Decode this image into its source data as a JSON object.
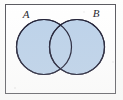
{
  "figure": {
    "type": "venn-diagram",
    "caption": "",
    "frame": {
      "x": 5,
      "y": 4,
      "width": 111,
      "height": 90,
      "stroke_color": "#5a5a60",
      "stroke_width": 1,
      "fill_color": "#ffffff"
    },
    "background_color": "#fdfdfc",
    "sets": [
      {
        "label": "A",
        "shape": "circle",
        "cx": 44,
        "cy": 47,
        "r": 27.5,
        "fill_color": "#bcd2ea",
        "stroke_color": "#1d1d33",
        "stroke_width": 1.2,
        "label_x": 26,
        "label_y": 18
      },
      {
        "label": "B",
        "shape": "circle",
        "cx": 77,
        "cy": 47,
        "r": 27.5,
        "fill_color": "#bcd2ea",
        "stroke_color": "#1d1d33",
        "stroke_width": 1.2,
        "label_x": 96,
        "label_y": 17
      }
    ],
    "intersection": {
      "shaded": true,
      "fill_color": "#bcd2ea",
      "description": "lens-shaped overlap region between circle A and circle B"
    },
    "shading": "both circles filled uniformly light blue, including the overlap",
    "regions_labeled": []
  }
}
